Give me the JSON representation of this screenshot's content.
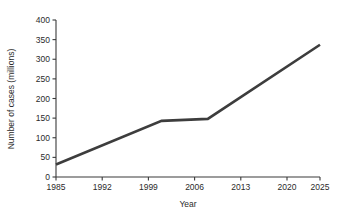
{
  "chart_data": {
    "type": "line",
    "title": "",
    "xlabel": "Year",
    "ylabel": "Number of cases (millions)",
    "xlim": [
      1985,
      2025
    ],
    "ylim": [
      0,
      400
    ],
    "grid": false,
    "legend": "none",
    "line_color": "#3d3d3d",
    "x_ticks": [
      1985,
      1992,
      1999,
      2006,
      2013,
      2020,
      2025
    ],
    "x_tick_labels": [
      "1985",
      "1992",
      "1999",
      "2006",
      "2013",
      "2020",
      "2025"
    ],
    "y_ticks": [
      0,
      50,
      100,
      150,
      200,
      250,
      300,
      350,
      400
    ],
    "y_tick_labels": [
      "0",
      "50",
      "100",
      "150",
      "200",
      "250",
      "300",
      "350",
      "400"
    ],
    "series": [
      {
        "name": "Number of cases",
        "x": [
          1985,
          2001,
          2008,
          2025
        ],
        "values": [
          32,
          143,
          148,
          337
        ]
      }
    ]
  }
}
